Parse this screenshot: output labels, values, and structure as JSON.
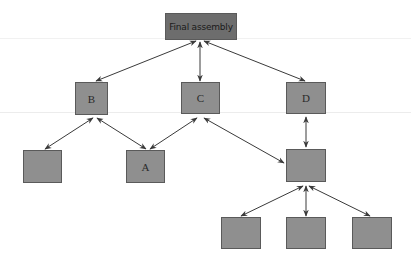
{
  "diagram": {
    "type": "hierarchy",
    "colors": {
      "node_fill": "#8f8f8f",
      "root_fill": "#6d6d6d",
      "border": "#5a5a5a",
      "edge": "#3a3a3a"
    },
    "nodes": [
      {
        "id": "root",
        "label": "Final assembly",
        "x": 165,
        "y": 13,
        "w": 72,
        "h": 27
      },
      {
        "id": "B",
        "label": "B",
        "x": 75,
        "y": 82,
        "w": 33,
        "h": 33
      },
      {
        "id": "C",
        "label": "C",
        "x": 181,
        "y": 82,
        "w": 39,
        "h": 32
      },
      {
        "id": "D",
        "label": "D",
        "x": 286,
        "y": 82,
        "w": 40,
        "h": 32
      },
      {
        "id": "B1",
        "label": "",
        "x": 23,
        "y": 150,
        "w": 39,
        "h": 33
      },
      {
        "id": "A",
        "label": "A",
        "x": 126,
        "y": 150,
        "w": 39,
        "h": 33
      },
      {
        "id": "E",
        "label": "",
        "x": 286,
        "y": 149,
        "w": 40,
        "h": 33
      },
      {
        "id": "E1",
        "label": "",
        "x": 221,
        "y": 217,
        "w": 40,
        "h": 32
      },
      {
        "id": "E2",
        "label": "",
        "x": 286,
        "y": 217,
        "w": 40,
        "h": 32
      },
      {
        "id": "E3",
        "label": "",
        "x": 352,
        "y": 217,
        "w": 40,
        "h": 32
      }
    ],
    "edges": [
      {
        "from": "root",
        "to": "B",
        "style": "bidirectional"
      },
      {
        "from": "root",
        "to": "C",
        "style": "bidirectional"
      },
      {
        "from": "root",
        "to": "D",
        "style": "bidirectional"
      },
      {
        "from": "B",
        "to": "B1",
        "style": "bidirectional"
      },
      {
        "from": "B",
        "to": "A",
        "style": "bidirectional"
      },
      {
        "from": "C",
        "to": "A",
        "style": "bidirectional"
      },
      {
        "from": "C",
        "to": "E",
        "style": "bidirectional"
      },
      {
        "from": "D",
        "to": "E",
        "style": "bidirectional"
      },
      {
        "from": "E",
        "to": "E1",
        "style": "bidirectional"
      },
      {
        "from": "E",
        "to": "E2",
        "style": "bidirectional"
      },
      {
        "from": "E",
        "to": "E3",
        "style": "bidirectional"
      }
    ]
  }
}
